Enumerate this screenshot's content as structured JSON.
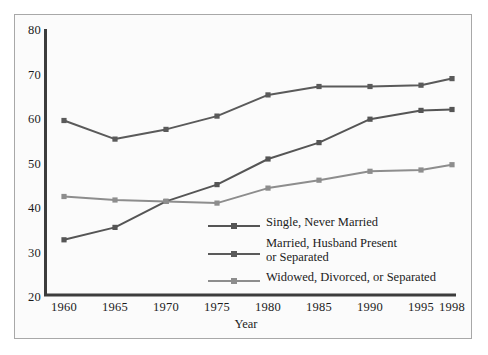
{
  "chart_data": {
    "type": "line",
    "title": "",
    "xlabel": "Year",
    "ylabel": "",
    "categories": [
      "1960",
      "1965",
      "1970",
      "1975",
      "1980",
      "1985",
      "1990",
      "1995",
      "1998"
    ],
    "x": [
      1960,
      1965,
      1970,
      1975,
      1980,
      1985,
      1990,
      1995,
      1998
    ],
    "xlim": [
      1960,
      1998
    ],
    "ylim": [
      20,
      80
    ],
    "yticks": [
      20,
      30,
      40,
      50,
      60,
      70,
      80
    ],
    "xticks": [
      1960,
      1965,
      1970,
      1975,
      1980,
      1985,
      1990,
      1995,
      1998
    ],
    "grid": false,
    "legend_position": "inside-center-bottom",
    "series": [
      {
        "name": "Single, Never Married",
        "color": "#555555",
        "values": [
          32.5,
          35.3,
          41.2,
          45.0,
          50.8,
          54.5,
          59.8,
          61.8,
          62.0
        ]
      },
      {
        "name": "Married, Husband Present or Separated",
        "color": "#5a5a5a",
        "values": [
          59.5,
          55.3,
          57.5,
          60.5,
          65.3,
          67.2,
          67.2,
          67.5,
          69.0
        ]
      },
      {
        "name": "Widowed, Divorced, or Separated",
        "color": "#8d8d8d",
        "values": [
          42.3,
          41.5,
          41.2,
          40.8,
          44.2,
          46.0,
          48.0,
          48.3,
          49.5
        ]
      }
    ]
  },
  "axes": {
    "y_tick_labels": [
      "80",
      "70",
      "60",
      "50",
      "40",
      "30",
      "20"
    ],
    "x_tick_labels": [
      "1960",
      "1965",
      "1970",
      "1975",
      "1980",
      "1985",
      "1990",
      "1995",
      "1998"
    ],
    "x_title": "Year"
  },
  "legend": {
    "entries": [
      {
        "line1": "Single, Never Married",
        "line2": "",
        "color": "#555555"
      },
      {
        "line1": "Married, Husband Present",
        "line2": "or Separated",
        "color": "#5a5a5a"
      },
      {
        "line1": "Widowed, Divorced, or Separated",
        "line2": "",
        "color": "#8d8d8d"
      }
    ]
  },
  "colors": {
    "axis": "#3c3c3c",
    "frame_border": "#a8a8a8",
    "background": "#fbfbfb",
    "text": "#1b1b1b"
  }
}
